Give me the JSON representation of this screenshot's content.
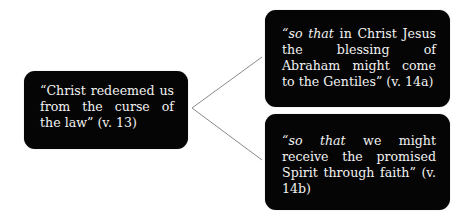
{
  "diagram": {
    "source_node": {
      "text": "“Christ redeemed us from the curse of the law” (v. 13)"
    },
    "target_nodes": [
      {
        "italic_lead": "“so that",
        "text": " in Christ Jesus the blessing of Abraham might come to the Gentiles” (v. 14a)"
      },
      {
        "italic_lead": "“so that",
        "text": " we might receive the promised Spirit through faith” (v. 14b)"
      }
    ],
    "colors": {
      "box_fill": "#050505",
      "box_text": "#f2f2f2",
      "connector": "#8a8a8a",
      "background": "#ffffff"
    }
  }
}
